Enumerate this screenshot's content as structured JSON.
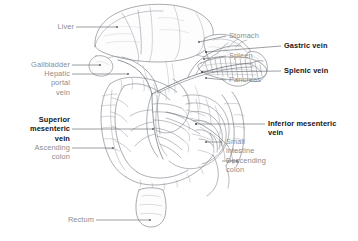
{
  "figure": {
    "style": "pencil-line-anatomical-illustration",
    "background_color": "#ffffff",
    "label_color": "#8c8c8c",
    "emphasis_label_color": "#16161a",
    "leader_line_color": "#5a5a5a",
    "drawing_stroke_color": "#6b6f78"
  },
  "labels": {
    "liver": "Liver",
    "gallbladder": "Gallbladder",
    "hepatic_portal_vein": "Hepatic\nportal\nvein",
    "superior_mesenteric_vein": "Superior\nmesenteric\nvein",
    "ascending_colon": "Ascending\ncolon",
    "rectum": "Rectum",
    "stomach": "Stomach",
    "spleen": "Spleen",
    "pancreas": "Pancreas",
    "gastric_vein": "Gastric vein",
    "splenic_vein": "Splenic vein",
    "inferior_mesenteric_vein": "Inferior mesenteric\nvein",
    "small_intestine": "Small\nintestine",
    "descending_colon": "Descending\ncolon"
  },
  "label_groups": {
    "left_plain": [
      "Liver",
      "Gallbladder",
      "Hepatic portal vein",
      "Ascending colon",
      "Rectum"
    ],
    "left_bold": [
      "Superior mesenteric vein"
    ],
    "right_plain": [
      "Stomach",
      "Spleen",
      "Pancreas",
      "Small intestine",
      "Descending colon"
    ],
    "right_bold": [
      "Gastric vein",
      "Splenic vein",
      "Inferior mesenteric vein"
    ]
  },
  "organs": [
    "Liver",
    "Gallbladder",
    "Stomach",
    "Spleen",
    "Pancreas",
    "Small intestine",
    "Ascending colon",
    "Descending colon",
    "Rectum"
  ],
  "veins": [
    "Hepatic portal vein",
    "Gastric vein",
    "Splenic vein",
    "Superior mesenteric vein",
    "Inferior mesenteric vein"
  ]
}
